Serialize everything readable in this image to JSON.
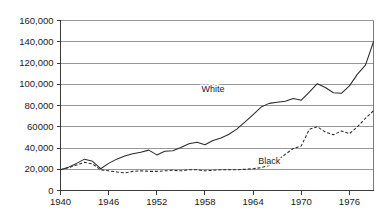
{
  "chart_data": {
    "type": "line",
    "title": "",
    "subtitle": "",
    "xlabel": "",
    "ylabel": "",
    "xlim": [
      1940,
      1979
    ],
    "ylim": [
      0,
      160000
    ],
    "grid": true,
    "legend_position": "inline-annotation",
    "y_ticks": [
      {
        "value": 160000,
        "label": "160,000"
      },
      {
        "value": 140000,
        "label": "140,000"
      },
      {
        "value": 120000,
        "label": "120,000"
      },
      {
        "value": 100000,
        "label": "100,000"
      },
      {
        "value": 80000,
        "label": "80,000"
      },
      {
        "value": 60000,
        "label": "60000"
      },
      {
        "value": 40000,
        "label": "40,000"
      },
      {
        "value": 20000,
        "label": "20,000"
      },
      {
        "value": 0,
        "label": "0"
      }
    ],
    "x_ticks": [
      {
        "value": 1940,
        "label": "1940"
      },
      {
        "value": 1946,
        "label": "1946"
      },
      {
        "value": 1952,
        "label": "1952"
      },
      {
        "value": 1958,
        "label": "1958"
      },
      {
        "value": 1964,
        "label": "1964"
      },
      {
        "value": 1970,
        "label": "1970"
      },
      {
        "value": 1976,
        "label": "1976"
      }
    ],
    "x": [
      1940,
      1941,
      1942,
      1943,
      1944,
      1945,
      1946,
      1947,
      1948,
      1949,
      1950,
      1951,
      1952,
      1953,
      1954,
      1955,
      1956,
      1957,
      1958,
      1959,
      1960,
      1961,
      1962,
      1963,
      1964,
      1965,
      1966,
      1967,
      1968,
      1969,
      1970,
      1971,
      1972,
      1973,
      1974,
      1975,
      1976,
      1977,
      1978,
      1979
    ],
    "series": [
      {
        "name": "White",
        "style": "solid",
        "color": "#2b2b2b",
        "label_x": 1959,
        "label_y": 95000,
        "values": [
          19500,
          22000,
          25500,
          29500,
          27500,
          20500,
          25500,
          29500,
          32500,
          34500,
          36000,
          38000,
          33500,
          37000,
          37500,
          40500,
          44000,
          45500,
          43000,
          47000,
          49500,
          53000,
          58000,
          64500,
          71500,
          78500,
          82000,
          83000,
          84000,
          86500,
          85000,
          92500,
          100500,
          97000,
          92000,
          91500,
          98500,
          109500,
          118000,
          140000
        ]
      },
      {
        "name": "Black",
        "style": "dashed",
        "color": "#2b2b2b",
        "label_x": 1966,
        "label_y": 27000,
        "values": [
          19500,
          21500,
          24000,
          26500,
          25000,
          19500,
          18500,
          17500,
          16500,
          18000,
          18500,
          18000,
          18000,
          18500,
          19000,
          18500,
          19500,
          19500,
          18500,
          19000,
          19500,
          19500,
          19500,
          20000,
          20500,
          21500,
          23500,
          28000,
          34000,
          39500,
          42000,
          57500,
          60000,
          55000,
          52500,
          56000,
          53500,
          60000,
          68000,
          75000
        ]
      }
    ]
  }
}
